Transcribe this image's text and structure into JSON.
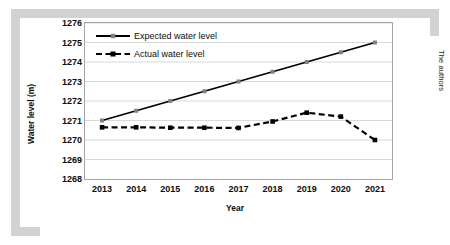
{
  "figure": {
    "credit": "The authors",
    "frame_color": "#d2d2d2",
    "plot_border_color": "#a6a6a6",
    "gridline_color": "#d9d9d9"
  },
  "chart_data": {
    "type": "line",
    "title": "",
    "xlabel": "Year",
    "ylabel": "Water level (m)",
    "categories": [
      "2013",
      "2014",
      "2015",
      "2016",
      "2017",
      "2018",
      "2019",
      "2020",
      "2021"
    ],
    "x": [
      2013,
      2014,
      2015,
      2016,
      2017,
      2018,
      2019,
      2020,
      2021
    ],
    "ylim": [
      1268,
      1276
    ],
    "yticks": [
      "1276",
      "1275",
      "1274",
      "1273",
      "1272",
      "1271",
      "1270",
      "1269",
      "1268"
    ],
    "ytick_values": [
      1276,
      1275,
      1274,
      1273,
      1272,
      1271,
      1270,
      1269,
      1268
    ],
    "grid": true,
    "grid_axis": "y",
    "legend_position": "top-left",
    "series": [
      {
        "name": "Expected water level",
        "color": "#000000",
        "marker_color": "#808080",
        "style": "solid",
        "values": [
          1271,
          1271.5,
          1272,
          1272.5,
          1273,
          1273.5,
          1274,
          1274.5,
          1275
        ]
      },
      {
        "name": "Actual water level",
        "color": "#000000",
        "marker_color": "#000000",
        "style": "dashed",
        "values": [
          1270.65,
          1270.65,
          1270.63,
          1270.63,
          1270.62,
          1270.95,
          1271.4,
          1271.2,
          1270.0
        ]
      }
    ]
  }
}
